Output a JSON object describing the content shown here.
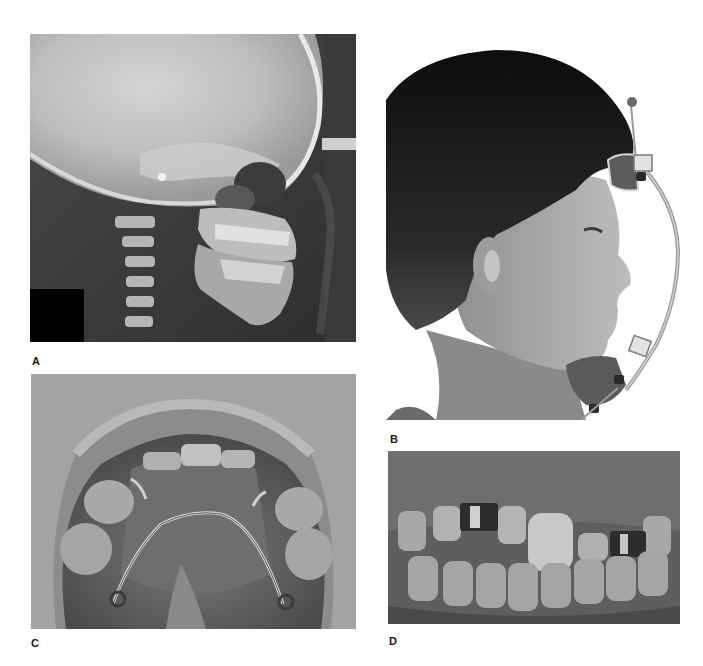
{
  "figure": {
    "panels": [
      {
        "id": "A",
        "label": "A",
        "description": "Lateral cephalometric radiograph of skull showing maxilla and mandible in profile",
        "tone": "grayscale"
      },
      {
        "id": "B",
        "label": "B",
        "description": "Profile photograph of child wearing a facemask (reverse-pull headgear) with forehead and chin pads",
        "tone": "grayscale"
      },
      {
        "id": "C",
        "label": "C",
        "description": "Occlusal intraoral view of maxillary arch with palatal wire appliance and clasps",
        "tone": "grayscale"
      },
      {
        "id": "D",
        "label": "D",
        "description": "Frontal intraoral view of anterior teeth with metal bands on two teeth",
        "tone": "grayscale"
      }
    ],
    "caption": "· · · ·  ·  · ·  · · ·  · ·  ·  · · · ·  · ·"
  },
  "colors": {
    "background": "#ffffff",
    "label": "#1a1a1a"
  }
}
